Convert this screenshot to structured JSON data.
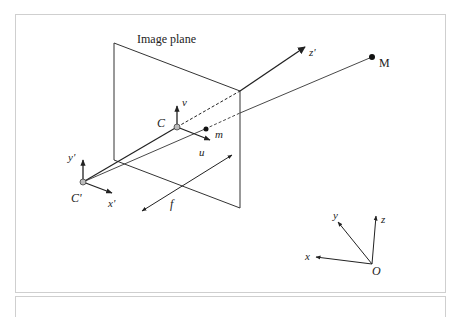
{
  "diagram": {
    "title": "Image plane",
    "labels": {
      "camera_center": "C'",
      "principal_point": "C",
      "image_point": "m",
      "world_point": "M",
      "focal_length": "f",
      "image_u": "u",
      "image_v": "v",
      "cam_x": "x'",
      "cam_y": "y'",
      "cam_z": "z'",
      "world_origin": "O",
      "world_x": "x",
      "world_y": "y",
      "world_z": "z"
    },
    "colors": {
      "line": "#222222",
      "point_fill_gray": "#bbbbbb",
      "frame_border": "#cfcfcf"
    }
  }
}
